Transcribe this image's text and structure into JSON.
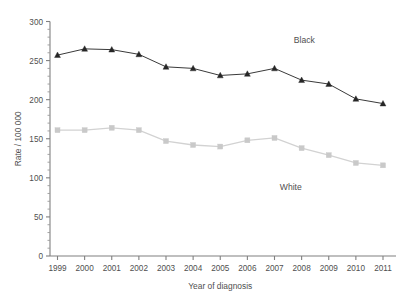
{
  "chart_data": {
    "type": "line",
    "title": "",
    "xlabel": "Year of diagnosis",
    "ylabel": "Rate / 100 000",
    "categories": [
      "1999",
      "2000",
      "2001",
      "2002",
      "2003",
      "2004",
      "2005",
      "2006",
      "2007",
      "2008",
      "2009",
      "2010",
      "2011"
    ],
    "x": [
      1999,
      2000,
      2001,
      2002,
      2003,
      2004,
      2005,
      2006,
      2007,
      2008,
      2009,
      2010,
      2011
    ],
    "xlim": [
      1999,
      2011
    ],
    "ylim": [
      0,
      300
    ],
    "y_ticks": [
      0,
      50,
      100,
      150,
      200,
      250,
      300
    ],
    "y_tick_labels": [
      "0",
      "50",
      "100",
      "150",
      "200",
      "250",
      "300"
    ],
    "y_minor_tick_step": 10,
    "grid": false,
    "legend": "inline-annotations",
    "series": [
      {
        "name": "Black",
        "marker": "triangle",
        "color": "#262626",
        "line_color": "#3a3a3a",
        "label_x": 2008.1,
        "label_y": 272,
        "values": [
          257,
          265,
          264,
          258,
          242,
          240,
          231,
          233,
          240,
          225,
          220,
          201,
          195
        ]
      },
      {
        "name": "White",
        "marker": "square",
        "color": "#c9c9c9",
        "line_color": "#d2d2d2",
        "label_x": 2007.6,
        "label_y": 85,
        "values": [
          161,
          161,
          164,
          161,
          147,
          142,
          140,
          148,
          151,
          138,
          129,
          119,
          116
        ]
      }
    ],
    "annotations": [
      {
        "text": "Black",
        "x": 2008.1,
        "y": 272
      },
      {
        "text": "White",
        "x": 2007.6,
        "y": 85
      }
    ],
    "colors": {
      "axis": "#808080",
      "text": "#4f4f4f",
      "black_series": "#262626",
      "white_series": "#c9c9c9",
      "background": "#ffffff"
    }
  }
}
